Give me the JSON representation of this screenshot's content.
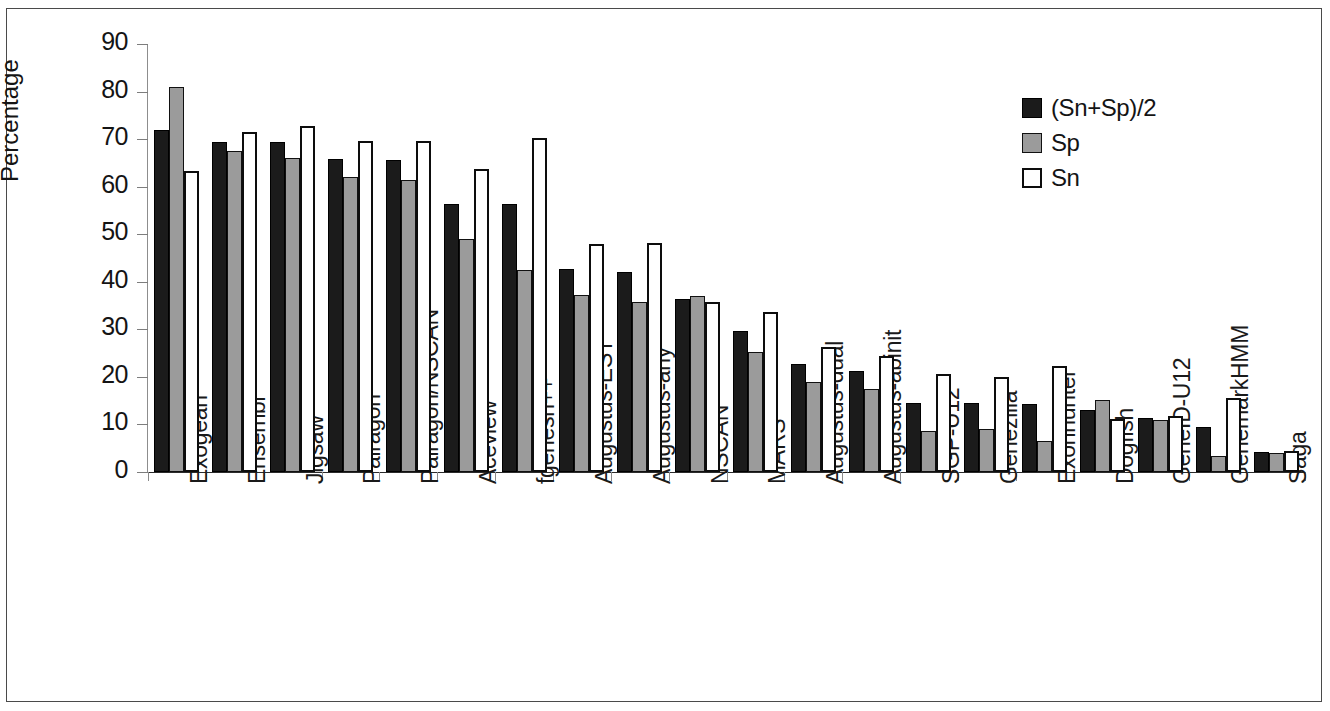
{
  "chart_data": {
    "type": "bar",
    "title": "",
    "xlabel": "",
    "ylabel": "Percentage",
    "ylim": [
      0,
      90
    ],
    "ytick_step": 10,
    "yticks": [
      90,
      80,
      70,
      60,
      50,
      40,
      30,
      20,
      10,
      0
    ],
    "grid": false,
    "legend_position": "top-right",
    "categories": [
      "Exogean",
      "Ensembl",
      "Jigsaw",
      "Pairagon",
      "Pairagon/NSCAN",
      "Aceview",
      "fgenesh++",
      "Augustus-EST",
      "Augustus-any",
      "NSCAN",
      "MARS",
      "Augustus-dual",
      "Augustus-abinit",
      "SGP-U12",
      "Genezilla",
      "Exonhunter",
      "Dogfish",
      "GeneID-U12",
      "GenemarkHMM",
      "Saga"
    ],
    "series": [
      {
        "name": "(Sn+Sp)/2",
        "color": "#1b1b1b",
        "values": [
          72.0,
          69.5,
          69.4,
          65.9,
          65.7,
          56.3,
          56.4,
          42.6,
          42.1,
          36.4,
          29.6,
          22.7,
          21.2,
          14.6,
          14.5,
          14.4,
          13.1,
          11.4,
          9.4,
          4.2
        ]
      },
      {
        "name": "Sp",
        "color": "#9b9b9b",
        "values": [
          80.9,
          67.4,
          66.0,
          62.0,
          61.5,
          49.0,
          42.4,
          37.3,
          35.8,
          37.0,
          25.3,
          19.0,
          17.5,
          8.7,
          9.1,
          6.6,
          15.2,
          11.0,
          3.4,
          4.0
        ]
      },
      {
        "name": "Sn",
        "color": "#ffffff",
        "values": [
          63.2,
          71.6,
          72.7,
          69.7,
          69.7,
          63.8,
          70.2,
          48.0,
          48.2,
          35.7,
          33.7,
          26.3,
          24.5,
          20.7,
          20.0,
          22.3,
          11.1,
          11.7,
          15.5,
          4.5
        ]
      }
    ]
  },
  "legend": {
    "items": [
      {
        "label": "(Sn+Sp)/2",
        "swatch": "black-filled-swatch"
      },
      {
        "label": "Sp",
        "swatch": "gray-filled-swatch"
      },
      {
        "label": "Sn",
        "swatch": "white-outlined-swatch"
      }
    ]
  }
}
